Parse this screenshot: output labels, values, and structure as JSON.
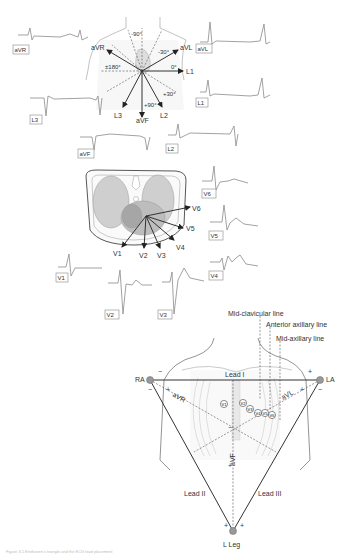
{
  "frontal_plane": {
    "angles": [
      "-90°",
      "-30°",
      "0°",
      "±180°",
      "+90°",
      "+30°"
    ],
    "leads": [
      "aVR",
      "aVL",
      "L1",
      "L3",
      "aVF",
      "L2"
    ]
  },
  "limb_trace_labels": [
    "aVR",
    "aVL",
    "L1",
    "L3",
    "aVF",
    "L2"
  ],
  "horizontal_plane": {
    "leads": [
      "V1",
      "V2",
      "V3",
      "V4",
      "V5",
      "V6"
    ]
  },
  "chest_trace_labels": [
    "V6",
    "V5",
    "V4",
    "V1",
    "V2",
    "V3"
  ],
  "torso_diagram": {
    "lines": [
      "Mid-clavicular line",
      "Anterior axillary line",
      "Mid-axillary line"
    ],
    "electrodes": [
      "RA",
      "LA",
      "L Leg"
    ],
    "lead_labels": [
      "Lead I",
      "Lead II",
      "Lead III",
      "aVR",
      "aVL",
      "aVF"
    ],
    "chest_electrodes": [
      "V1",
      "V2",
      "V3",
      "V4",
      "V5",
      "V6"
    ],
    "signs": {
      "plus": "+",
      "minus": "−"
    }
  },
  "caption": "Figure 3.1 Einthoven's triangle and the ECG lead placement"
}
